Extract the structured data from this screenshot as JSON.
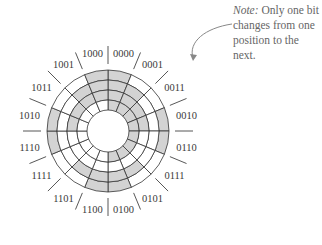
{
  "diagram": {
    "type": "gray-code-encoder-disk",
    "center": [
      108,
      131
    ],
    "ring_radii": [
      61,
      51,
      41,
      31,
      21
    ],
    "shade_color": "#d3d3d3",
    "line_color": "#333333",
    "codes": [
      "0000",
      "0001",
      "0011",
      "0010",
      "0110",
      "0111",
      "0101",
      "0100",
      "1100",
      "1101",
      "1111",
      "1110",
      "1010",
      "1011",
      "1001",
      "1000"
    ]
  },
  "note": {
    "prefix": "Note:",
    "text": " Only one bit changes from one position to the next."
  }
}
